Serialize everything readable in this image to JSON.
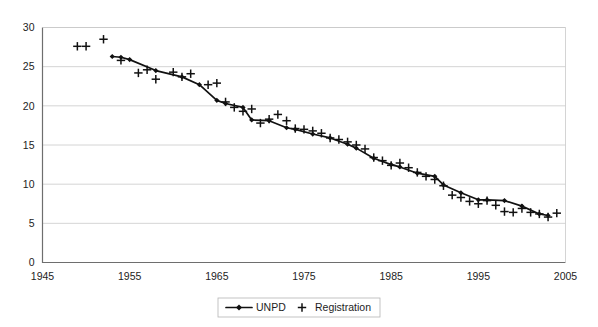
{
  "chart_data": {
    "type": "line",
    "title": "",
    "subtitle": "",
    "xlabel": "",
    "ylabel": "",
    "xlim": [
      1945,
      2005
    ],
    "ylim": [
      0,
      30
    ],
    "xticks": [
      1945,
      1955,
      1965,
      1975,
      1985,
      1995,
      2005
    ],
    "yticks": [
      0,
      5,
      10,
      15,
      20,
      25,
      30
    ],
    "grid": "horizontal",
    "legend_position": "bottom-center",
    "series": [
      {
        "name": "UNPD",
        "marker": "diamond",
        "style": "line-with-markers",
        "x": [
          1953,
          1954,
          1955,
          1958,
          1961,
          1963,
          1965,
          1966,
          1968,
          1969,
          1971,
          1973,
          1974,
          1976,
          1978,
          1980,
          1981,
          1983,
          1985,
          1986,
          1988,
          1990,
          1991,
          1993,
          1995,
          1996,
          1998,
          2000,
          2002,
          2003
        ],
        "values": [
          26.3,
          26.2,
          25.9,
          24.5,
          23.7,
          22.7,
          20.7,
          20.3,
          19.8,
          18.2,
          18.1,
          17.2,
          17.0,
          16.4,
          15.9,
          15.1,
          14.6,
          13.3,
          12.5,
          12.2,
          11.4,
          11.0,
          9.9,
          8.9,
          8.0,
          8.0,
          7.9,
          7.2,
          6.2,
          6.0
        ]
      },
      {
        "name": "Registration",
        "marker": "plus",
        "style": "markers-only",
        "x": [
          1949,
          1950,
          1952,
          1954,
          1956,
          1957,
          1958,
          1960,
          1961,
          1962,
          1964,
          1965,
          1966,
          1967,
          1968,
          1969,
          1970,
          1971,
          1972,
          1973,
          1974,
          1975,
          1976,
          1977,
          1978,
          1979,
          1980,
          1981,
          1982,
          1983,
          1984,
          1985,
          1986,
          1987,
          1988,
          1989,
          1990,
          1991,
          1992,
          1993,
          1994,
          1995,
          1996,
          1997,
          1998,
          1999,
          2000,
          2001,
          2002,
          2003,
          2004
        ],
        "values": [
          27.6,
          27.6,
          28.5,
          25.8,
          24.2,
          24.6,
          23.4,
          24.3,
          23.7,
          24.1,
          22.7,
          22.9,
          20.5,
          19.8,
          19.3,
          19.6,
          17.8,
          18.3,
          18.9,
          18.1,
          17.1,
          17.0,
          16.8,
          16.5,
          15.9,
          15.7,
          15.4,
          15.0,
          14.5,
          13.4,
          13.0,
          12.4,
          12.7,
          12.1,
          11.5,
          11.0,
          10.6,
          9.8,
          8.6,
          8.3,
          7.8,
          7.5,
          7.9,
          7.3,
          6.5,
          6.4,
          6.9,
          6.4,
          6.2,
          5.8,
          6.3
        ]
      }
    ]
  },
  "legend": {
    "items": [
      {
        "label": "UNPD",
        "marker": "line-diamond"
      },
      {
        "label": "Registration",
        "marker": "plus"
      }
    ]
  },
  "colors": {
    "series": "#111111",
    "grid": "#c9c9c9",
    "axis": "#6e6e6e",
    "background": "#ffffff"
  }
}
